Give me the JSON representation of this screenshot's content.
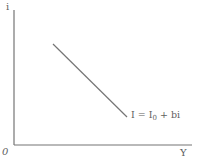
{
  "diagram": {
    "type": "qualitative-line-diagram",
    "axes": {
      "y_axis_label": "i",
      "x_axis_label": "Y",
      "origin_label": "0",
      "geometry": {
        "y_axis": {
          "x": 14,
          "y_top": 10,
          "y_bottom": 145
        },
        "x_axis": {
          "x_left": 14,
          "x_right": 192,
          "y": 145
        }
      }
    },
    "curve": {
      "label": {
        "before_sub": "I = I",
        "sub": "0",
        "after_sub": " + bi"
      },
      "slope": "negative",
      "x1": 53,
      "y1": 44,
      "x2": 127,
      "y2": 117
    },
    "colors": {
      "line": "#757575",
      "text": "#5f5f5f",
      "background": "#ffffff"
    }
  }
}
